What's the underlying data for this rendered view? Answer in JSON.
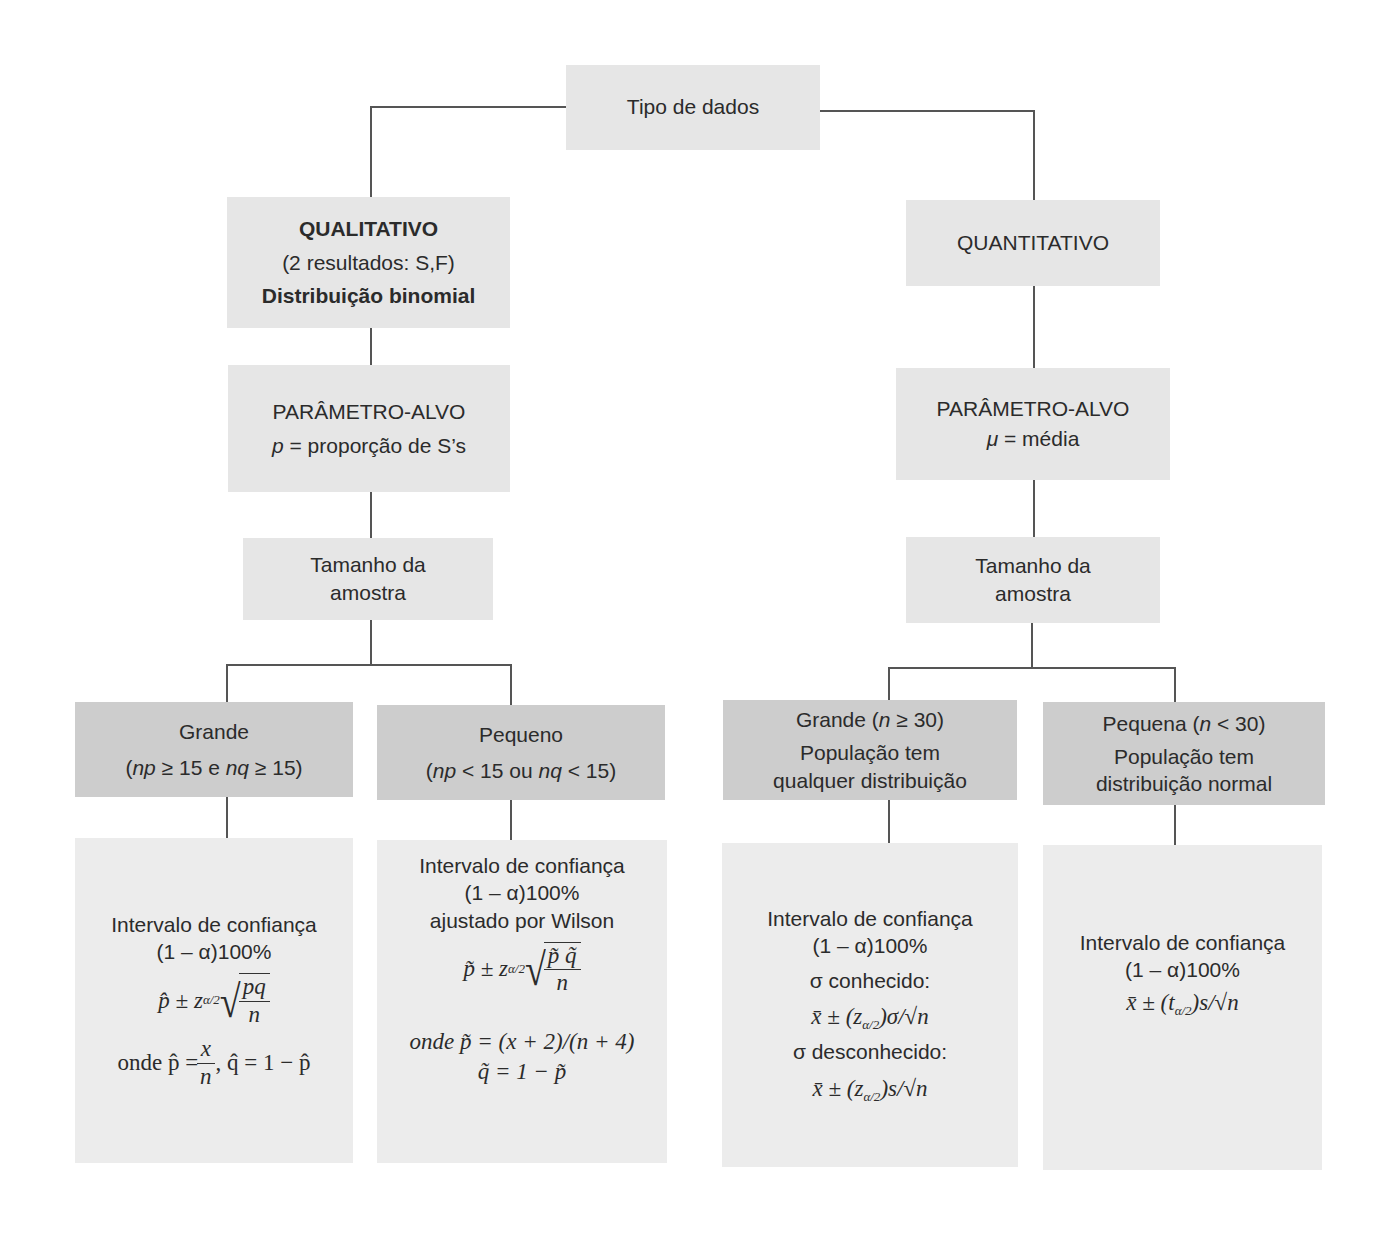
{
  "root": {
    "label": "Tipo de dados"
  },
  "left": {
    "type": {
      "title": "QUALITATIVO",
      "subtitle": "(2 resultados: S,F)",
      "distribution": "Distribuição binomial"
    },
    "parameter": {
      "title": "PARÂMETRO-ALVO",
      "symbol": "p",
      "definition": " = proporção de S’s"
    },
    "sample_size": {
      "line1": "Tamanho da",
      "line2": "amostra"
    },
    "large": {
      "title": "Grande",
      "cond_open": "(",
      "np": "np",
      "cond_mid1": " ≥ 15 e ",
      "nq": "nq",
      "cond_mid2": " ≥ 15)"
    },
    "small": {
      "title": "Pequeno",
      "cond_open": "(",
      "np": "np",
      "cond_mid1": " < 15 ou ",
      "nq": "nq",
      "cond_mid2": " < 15)"
    },
    "large_result": {
      "heading": "Intervalo de confiança",
      "level": "(1 – α)100%",
      "formula_lhs": "p̂ ± z",
      "formula_sub": "α/2",
      "frac_num": "pq",
      "frac_den": "n",
      "where_prefix": "onde p̂ = ",
      "where_num": "x",
      "where_den": "n",
      "where_suffix": ", q̂ = 1 − p̂"
    },
    "small_result": {
      "heading": "Intervalo de confiança",
      "level": "(1 – α)100%",
      "adjust": "ajustado por Wilson",
      "formula_lhs": "p̃ ± z",
      "formula_sub": "α/2",
      "frac_num": "p̃ q̃",
      "frac_den": "n",
      "where1": "onde  p̃ = (x + 2)/(n + 4)",
      "where2": "q̃ = 1 − p̃"
    }
  },
  "right": {
    "type": {
      "title": "QUANTITATIVO"
    },
    "parameter": {
      "title": "PARÂMETRO-ALVO",
      "symbol": "μ",
      "definition": " = média"
    },
    "sample_size": {
      "line1": "Tamanho da",
      "line2": "amostra"
    },
    "large": {
      "title_prefix": "Grande (",
      "n": "n",
      "title_suffix": " ≥ 30)",
      "line2": "População tem",
      "line3": "qualquer distribuição"
    },
    "small": {
      "title_prefix": "Pequena (",
      "n": "n",
      "title_suffix": " < 30)",
      "line2": "População tem",
      "line3": "distribuição normal"
    },
    "large_result": {
      "heading": "Intervalo de confiança",
      "level": "(1 – α)100%",
      "known_label": "σ conhecido:",
      "known_formula_a": "x̄ ± (z",
      "known_formula_sub": "α/2",
      "known_formula_b": ")σ/√n",
      "unknown_label": "σ desconhecido:",
      "unknown_formula_a": "x̄ ± (z",
      "unknown_formula_sub": "α/2",
      "unknown_formula_b": ")s/√n"
    },
    "small_result": {
      "heading": "Intervalo de confiança",
      "level": "(1 – α)100%",
      "formula_a": "x̄ ± (t",
      "formula_sub": "α/2",
      "formula_b": ")s/√n"
    }
  },
  "colors": {
    "box_light": "#e6e6e6",
    "box_dark": "#cdcdcd",
    "line": "#555555",
    "text": "#2b2b2b"
  }
}
